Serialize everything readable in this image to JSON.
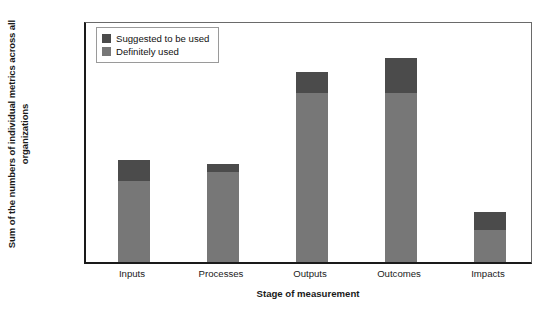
{
  "chart_data": {
    "type": "bar",
    "stacked": true,
    "title": "",
    "xlabel": "Stage of measurement",
    "ylabel": "Sum of the numbers of individual metrics across all organizations",
    "categories": [
      "Inputs",
      "Processes",
      "Outputs",
      "Outcomes",
      "Impacts"
    ],
    "series": [
      {
        "name": "Definitely used",
        "color": "#777777",
        "values": [
          100,
          112,
          210,
          210,
          40
        ]
      },
      {
        "name": "Suggested to be used",
        "color": "#4b4b4b",
        "values": [
          27,
          10,
          25,
          43,
          22
        ]
      }
    ],
    "totals": [
      127,
      122,
      235,
      253,
      62
    ],
    "ylim": [
      0,
      300
    ],
    "yticks": [
      0,
      50,
      100,
      150,
      200,
      250,
      300
    ],
    "ytick_labels": [
      "0",
      "50",
      "100",
      "150",
      "200",
      "250",
      "300"
    ],
    "grid": false,
    "legend_position": "top-left"
  },
  "legend": {
    "entries": [
      {
        "label": "Suggested to be used",
        "color": "#4b4b4b"
      },
      {
        "label": "Definitely used",
        "color": "#777777"
      }
    ]
  }
}
